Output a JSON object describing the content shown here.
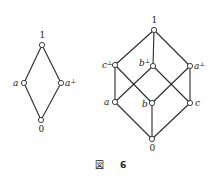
{
  "figure": {
    "caption_label": "図",
    "caption_number": "6"
  },
  "left_lattice": {
    "nodes": {
      "top": {
        "label": "1"
      },
      "a": {
        "label": "a"
      },
      "a_perp": {
        "label": "a",
        "sup": "⊥"
      },
      "bottom": {
        "label": "0"
      }
    }
  },
  "right_lattice": {
    "nodes": {
      "top": {
        "label": "1"
      },
      "c_perp": {
        "label": "c",
        "sup": "⊥"
      },
      "b_perp": {
        "label": "b",
        "sup": "⊥"
      },
      "a_perp": {
        "label": "a",
        "sup": "⊥"
      },
      "a": {
        "label": "a"
      },
      "b": {
        "label": "b"
      },
      "c": {
        "label": "c"
      },
      "bottom": {
        "label": "0"
      }
    }
  }
}
